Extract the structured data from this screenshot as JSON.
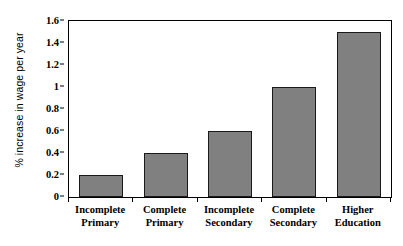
{
  "chart_data": {
    "type": "bar",
    "title": "",
    "subtitle": "",
    "xlabel": "",
    "ylabel": "% increase in wage per year",
    "categories": [
      "Incomplete Primary",
      "Complete Primary",
      "Incomplete Secondary",
      "Complete Secondary",
      "Higher Education"
    ],
    "category_lines": [
      [
        "Incomplete",
        "Primary"
      ],
      [
        "Complete",
        "Primary"
      ],
      [
        "Incomplete",
        "Secondary"
      ],
      [
        "Complete",
        "Secondary"
      ],
      [
        "Higher",
        "Education"
      ]
    ],
    "values": [
      0.2,
      0.4,
      0.6,
      1.0,
      1.5
    ],
    "ylim": [
      0,
      1.6
    ],
    "ytick_values": [
      0,
      0.2,
      0.4,
      0.6,
      0.8,
      1,
      1.2,
      1.4,
      1.6
    ],
    "ytick_labels": [
      "0",
      "0.2",
      "0.4",
      "0.6",
      "0.8",
      "1",
      "1.2",
      "1.4",
      "1.6"
    ],
    "grid": false,
    "legend": false,
    "legend_position": "none",
    "bar_color": "#808080",
    "bar_edge_color": "#1a1a1a",
    "axis_color": "#000000",
    "background_color": "#ffffff"
  }
}
